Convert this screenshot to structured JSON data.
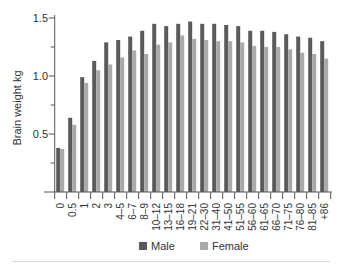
{
  "chart_data": {
    "type": "bar",
    "title": "",
    "xlabel": "",
    "ylabel": "Brain weight kg",
    "ylim": [
      0,
      1.5
    ],
    "yticks": [
      0.5,
      1.0,
      1.5
    ],
    "ytick_labels": [
      "0.5",
      "1.0",
      "1.5"
    ],
    "minor_yticks": [
      0.25,
      0.75,
      1.25
    ],
    "grid": false,
    "legend_position": "bottom",
    "categories": [
      "0",
      "0.5",
      "1",
      "2",
      "3",
      "4–5",
      "6–7",
      "8–9",
      "10–12",
      "13–15",
      "16–18",
      "19–21",
      "22–30",
      "31–40",
      "41–50",
      "51–55",
      "56–60",
      "61–65",
      "66–70",
      "71–75",
      "76–80",
      "81–85",
      "+86"
    ],
    "series": [
      {
        "name": "Male",
        "color": "#5a5a5a",
        "values": [
          0.38,
          0.64,
          0.99,
          1.13,
          1.29,
          1.31,
          1.34,
          1.39,
          1.45,
          1.43,
          1.45,
          1.47,
          1.45,
          1.45,
          1.44,
          1.43,
          1.39,
          1.39,
          1.38,
          1.36,
          1.34,
          1.33,
          1.3
        ]
      },
      {
        "name": "Female",
        "color": "#a9a9a9",
        "values": [
          0.37,
          0.58,
          0.94,
          1.05,
          1.1,
          1.16,
          1.22,
          1.19,
          1.27,
          1.29,
          1.35,
          1.32,
          1.31,
          1.3,
          1.3,
          1.29,
          1.26,
          1.25,
          1.25,
          1.23,
          1.2,
          1.19,
          1.15
        ]
      }
    ]
  },
  "legend": {
    "male_label": "Male",
    "female_label": "Female"
  },
  "axis": {
    "ylabel": "Brain weight kg",
    "ytick_labels": [
      "0.5",
      "1.0",
      "1.5"
    ]
  }
}
